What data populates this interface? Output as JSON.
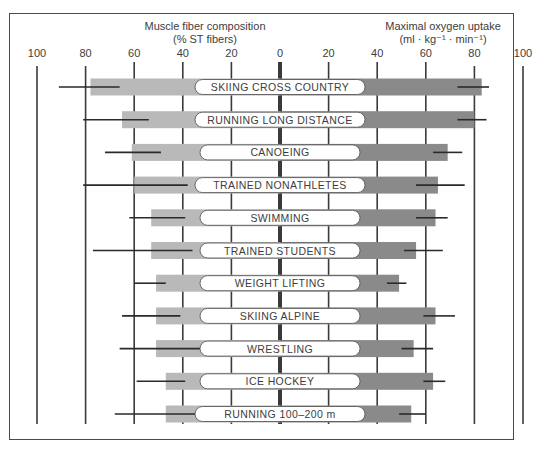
{
  "chart_data": {
    "type": "bar",
    "subtype": "diverging-horizontal-bar-with-range-whiskers",
    "title": "",
    "left_axis": {
      "title_line1": "Muscle fiber composition",
      "title_line2": "(% ST fibers)",
      "ticks": [
        100,
        80,
        60,
        40,
        20,
        0
      ],
      "range": [
        0,
        100
      ],
      "direction": "right-to-left"
    },
    "right_axis": {
      "title_line1": "Maximal oxygen uptake",
      "title_line2": "(ml · kg⁻¹ · min⁻¹)",
      "ticks": [
        20,
        40,
        60,
        80,
        100
      ],
      "range": [
        0,
        100
      ],
      "direction": "left-to-right"
    },
    "grid": true,
    "legend": null,
    "categories": [
      "SKIING CROSS COUNTRY",
      "RUNNING LONG DISTANCE",
      "CANOEING",
      "TRAINED NONATHLETES",
      "SWIMMING",
      "TRAINED STUDENTS",
      "WEIGHT LIFTING",
      "SKIING ALPINE",
      "WRESTLING",
      "ICE HOCKEY",
      "RUNNING 100–200 m"
    ],
    "series": [
      {
        "name": "Muscle fiber composition (% ST fibers)",
        "side": "left",
        "color": "#b9b9b9",
        "values": [
          78,
          65,
          61,
          60,
          53,
          53,
          51,
          51,
          51,
          47,
          47
        ],
        "range_low": [
          66,
          54,
          49,
          38,
          39,
          36,
          47,
          41,
          33,
          39,
          35
        ],
        "range_high": [
          91,
          81,
          72,
          81,
          62,
          77,
          60,
          65,
          66,
          59,
          68
        ]
      },
      {
        "name": "Maximal oxygen uptake (ml·kg⁻¹·min⁻¹)",
        "side": "right",
        "color": "#8a8a8a",
        "values": [
          83,
          80,
          69,
          65,
          64,
          56,
          49,
          64,
          55,
          63,
          54
        ],
        "range_low": [
          73,
          73,
          63,
          56,
          56,
          51,
          44,
          59,
          50,
          59,
          49
        ],
        "range_high": [
          86,
          85,
          75,
          76,
          69,
          67,
          52,
          72,
          63,
          68,
          60
        ]
      }
    ]
  }
}
